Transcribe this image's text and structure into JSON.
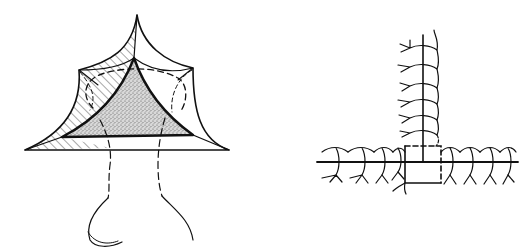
{
  "figure": {
    "background": "#ffffff",
    "ink_color": "#111111",
    "stipple_color": "#777777",
    "panels": [
      {
        "id": "left",
        "description": "Pyramidal tent-like structure with curved cusped outer surface, hatched shading on left face, stippled inner triangular region and dashed stalk with hooked base"
      },
      {
        "id": "right",
        "description": "T-shaped branching axis with repeated arched segments and forked lateral appendages around a central dashed square"
      }
    ]
  }
}
